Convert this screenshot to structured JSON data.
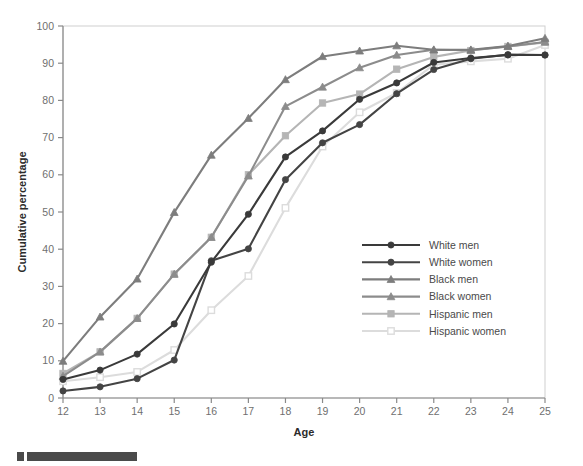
{
  "chart_data": {
    "type": "line",
    "title": "",
    "xlabel": "Age",
    "ylabel": "Cumulative percentage",
    "xlim": [
      12,
      25
    ],
    "ylim": [
      0,
      100
    ],
    "grid": false,
    "legend_position": "center-right",
    "x": [
      12,
      13,
      14,
      15,
      16,
      17,
      18,
      19,
      20,
      21,
      22,
      23,
      24,
      25
    ],
    "xticklabels": [
      "12",
      "13",
      "14",
      "15",
      "16",
      "17",
      "18",
      "19",
      "20",
      "21",
      "22",
      "23",
      "24",
      "25"
    ],
    "yticklabels": [
      "0",
      "10",
      "20",
      "30",
      "40",
      "50",
      "60",
      "70",
      "80",
      "90",
      "100"
    ],
    "yticks": [
      0,
      10,
      20,
      30,
      40,
      50,
      60,
      70,
      80,
      90,
      100
    ],
    "series": [
      {
        "name": "White men",
        "color": "#3a3a3a",
        "marker": "circle",
        "values": [
          5.0,
          7.5,
          11.8,
          19.9,
          36.5,
          49.4,
          64.8,
          71.8,
          80.3,
          84.7,
          90.2,
          91.4,
          92.2,
          92.2
        ]
      },
      {
        "name": "White women",
        "color": "#444444",
        "marker": "circle",
        "values": [
          1.9,
          3.0,
          5.2,
          10.2,
          36.9,
          40.1,
          58.7,
          68.6,
          73.5,
          81.8,
          88.3,
          91.2,
          92.3,
          92.2
        ]
      },
      {
        "name": "Black men",
        "color": "#7d7d7d",
        "marker": "triangle",
        "values": [
          9.9,
          21.8,
          32.0,
          49.9,
          65.3,
          75.2,
          85.6,
          91.8,
          93.3,
          94.7,
          93.6,
          93.6,
          94.6,
          96.7
        ]
      },
      {
        "name": "Black women",
        "color": "#8c8c8c",
        "marker": "triangle",
        "values": [
          5.9,
          12.4,
          21.4,
          33.3,
          43.2,
          59.7,
          78.4,
          83.6,
          88.8,
          92.2,
          93.6,
          93.5,
          94.5,
          95.7
        ]
      },
      {
        "name": "Hispanic men",
        "color": "#b5b5b5",
        "marker": "square",
        "values": [
          6.6,
          12.4,
          21.4,
          33.3,
          43.2,
          60.0,
          70.5,
          79.3,
          81.7,
          88.4,
          91.7,
          93.4,
          94.5,
          95.6
        ]
      },
      {
        "name": "Hispanic women",
        "color": "#dcdcdc",
        "marker": "square-open",
        "values": [
          4.5,
          5.6,
          7.0,
          12.9,
          23.6,
          32.8,
          51.1,
          67.6,
          76.8,
          82.0,
          89.6,
          90.5,
          91.2,
          94.9
        ]
      }
    ]
  },
  "footer": {
    "bar_color": "#4a4a4a"
  }
}
